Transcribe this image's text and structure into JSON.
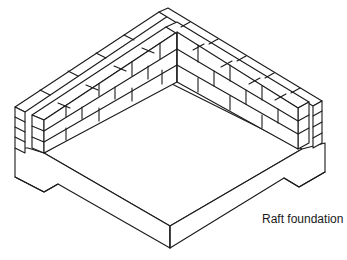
{
  "figure": {
    "caption": "Raft foundation",
    "components": [
      {
        "name": "outer-brick-leaf",
        "description": "Outer leaf of brickwork along two walls meeting at a rear corner"
      },
      {
        "name": "inner-brick-leaf",
        "description": "Inner leaf of brickwork with cavity between leaves"
      },
      {
        "name": "raft-slab",
        "description": "Concrete raft slab with downstand edge thickening"
      }
    ],
    "colors": {
      "line": "#1a1a1a",
      "background": "#ffffff"
    }
  }
}
